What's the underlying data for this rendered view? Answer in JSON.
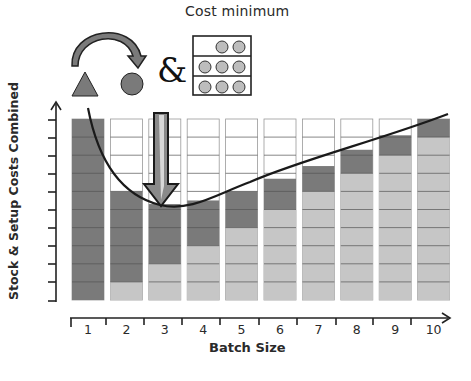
{
  "title": "Cost minimum",
  "icons": {
    "triangle": "triangle-setup-icon",
    "curved_arrow": "curved-arrow-icon",
    "circle": "circle-setup-icon",
    "ampersand": "&",
    "shelf": "stock-shelf-icon"
  },
  "axes": {
    "ylabel": "Stock & Setup Costs Combined",
    "xlabel": "Batch Size",
    "xticks": [
      "1",
      "2",
      "3",
      "4",
      "5",
      "6",
      "7",
      "8",
      "9",
      "10"
    ]
  },
  "colors": {
    "setup": "#7a7a7a",
    "stock": "#c6c6c6",
    "empty": "#ffffff",
    "grid_line": "#555555",
    "curve": "#1a1a1a"
  },
  "chart_data": {
    "type": "bar",
    "title": "Cost minimum",
    "xlabel": "Batch Size",
    "ylabel": "Stock & Setup Costs Combined",
    "categories": [
      "1",
      "2",
      "3",
      "4",
      "5",
      "6",
      "7",
      "8",
      "9",
      "10"
    ],
    "series": [
      {
        "name": "Stock cost",
        "values": [
          0,
          1,
          2,
          3,
          4,
          5,
          6,
          7,
          8,
          9
        ]
      },
      {
        "name": "Setup cost",
        "values": [
          10,
          5,
          3.3,
          2.5,
          2,
          1.7,
          1.4,
          1.3,
          1.1,
          1
        ]
      }
    ],
    "totals": [
      10,
      6,
      5.3,
      5.5,
      6,
      6.7,
      7.4,
      8.3,
      9.1,
      10
    ],
    "ylim": [
      0,
      10
    ],
    "units_per_column": 10,
    "minimum_at": "3",
    "annotations": [
      "Cost minimum arrow pointing at batch size 3",
      "Curve of combined cost"
    ],
    "grid": true,
    "legend": "none"
  }
}
